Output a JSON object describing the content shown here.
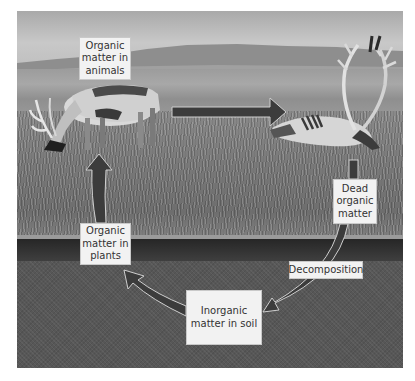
{
  "diagram": {
    "nodes": [
      {
        "id": "animals",
        "label": "Organic\nmatter in\nanimals"
      },
      {
        "id": "dead",
        "label": "Dead\norganic\nmatter"
      },
      {
        "id": "decomposition",
        "label": "Decomposition"
      },
      {
        "id": "inorganic",
        "label": "Inorganic\nmatter in soil"
      },
      {
        "id": "plants",
        "label": "Organic\nmatter in\nplants"
      }
    ],
    "edges": [
      {
        "from": "animals",
        "to": "dead"
      },
      {
        "from": "dead",
        "to": "inorganic",
        "label": "Decomposition"
      },
      {
        "from": "inorganic",
        "to": "plants"
      },
      {
        "from": "plants",
        "to": "animals"
      }
    ],
    "scene": {
      "background": "tundra photograph: sky, distant hills, grassland, soil cross-section",
      "left_figure": "grazing caribou",
      "right_figure": "dead caribou carcass with antlers"
    },
    "colors": {
      "arrow_fill": "#3c3c3c",
      "arrow_outline": "#cfcfcf",
      "label_bg": "#f2f2f2",
      "label_text": "#333333"
    }
  }
}
